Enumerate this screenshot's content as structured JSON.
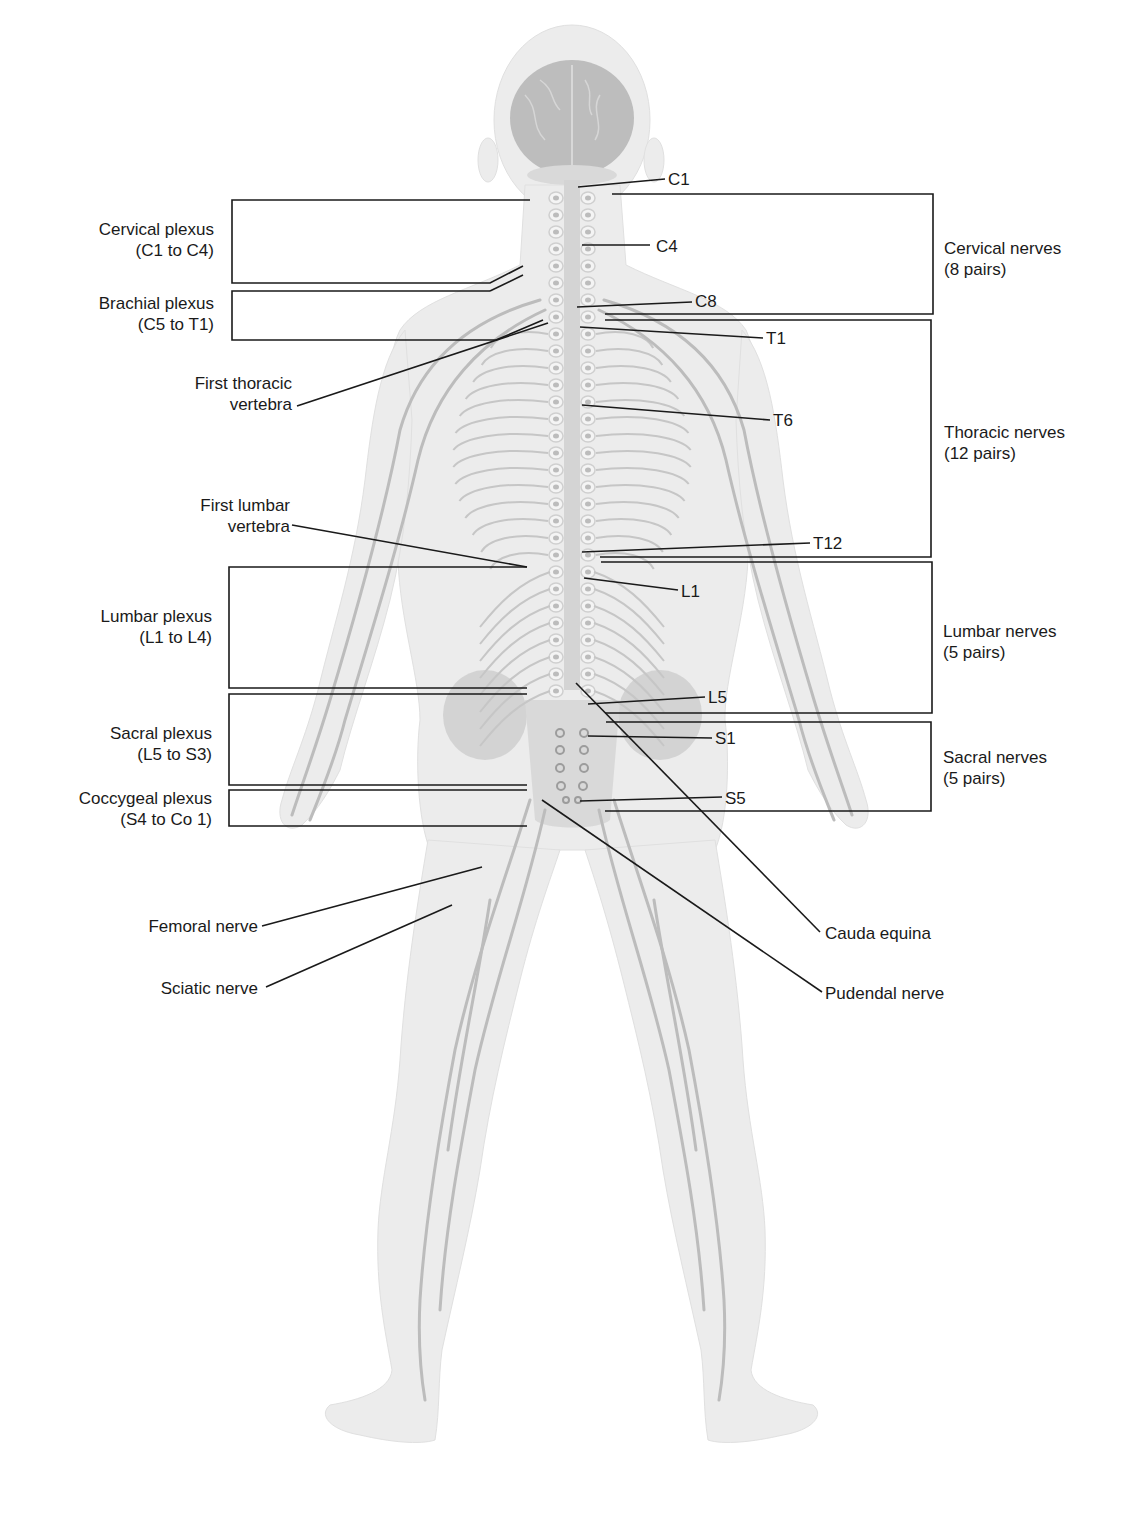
{
  "colors": {
    "background": "#ffffff",
    "body_fill": "#ececec",
    "body_edge": "#dcdcdc",
    "nerve": "#b9b9b9",
    "brain": "#a8a8a8",
    "leader_line": "#1a1a1a",
    "text": "#1a1a1a"
  },
  "left_labels": {
    "cervical_plexus": {
      "line1": "Cervical plexus",
      "line2": "(C1 to C4)"
    },
    "brachial_plexus": {
      "line1": "Brachial plexus",
      "line2": "(C5 to T1)"
    },
    "first_thoracic_vertebra": {
      "line1": "First thoracic",
      "line2": "vertebra"
    },
    "first_lumbar_vertebra": {
      "line1": "First lumbar",
      "line2": "vertebra"
    },
    "lumbar_plexus": {
      "line1": "Lumbar plexus",
      "line2": "(L1 to L4)"
    },
    "sacral_plexus": {
      "line1": "Sacral plexus",
      "line2": "(L5 to S3)"
    },
    "coccygeal_plexus": {
      "line1": "Coccygeal plexus",
      "line2": "(S4 to Co 1)"
    },
    "femoral_nerve": {
      "line1": "Femoral nerve"
    },
    "sciatic_nerve": {
      "line1": "Sciatic nerve"
    }
  },
  "segment_labels": {
    "c1": "C1",
    "c4": "C4",
    "c8": "C8",
    "t1": "T1",
    "t6": "T6",
    "t12": "T12",
    "l1": "L1",
    "l5": "L5",
    "s1": "S1",
    "s5": "S5"
  },
  "right_labels": {
    "cervical_nerves": {
      "line1": "Cervical nerves",
      "line2": "(8 pairs)"
    },
    "thoracic_nerves": {
      "line1": "Thoracic nerves",
      "line2": "(12 pairs)"
    },
    "lumbar_nerves": {
      "line1": "Lumbar nerves",
      "line2": "(5 pairs)"
    },
    "sacral_nerves": {
      "line1": "Sacral nerves",
      "line2": "(5 pairs)"
    },
    "cauda_equina": {
      "line1": "Cauda equina"
    },
    "pudendal_nerve": {
      "line1": "Pudendal nerve"
    }
  }
}
